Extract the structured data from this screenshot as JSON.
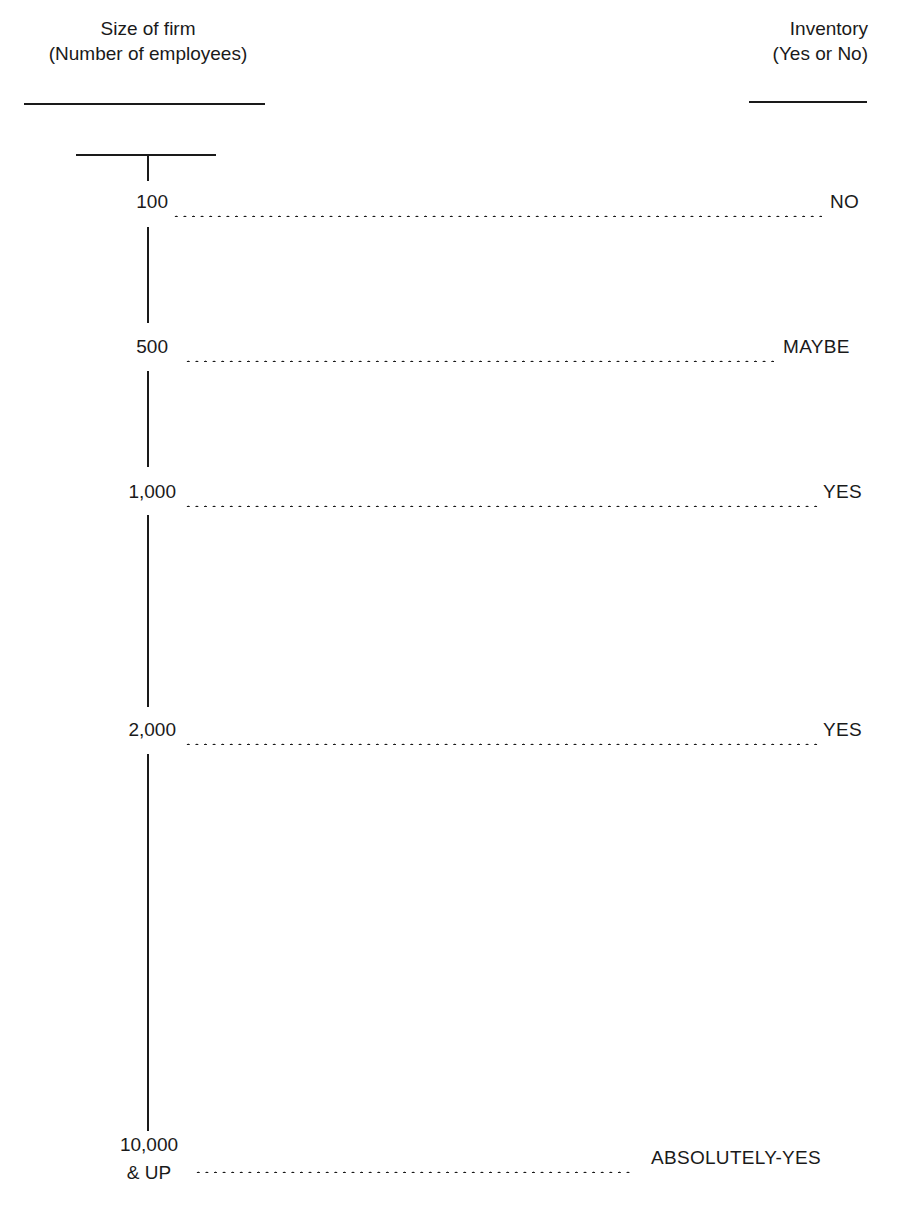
{
  "headers": {
    "left": {
      "line1": "Size of firm",
      "line2": "(Number of employees)"
    },
    "right": {
      "line1": "Inventory",
      "line2": "(Yes or No)"
    }
  },
  "rows": [
    {
      "size": "100",
      "inventory": "NO"
    },
    {
      "size": "500",
      "inventory": "MAYBE"
    },
    {
      "size": "1,000",
      "inventory": "YES"
    },
    {
      "size": "2,000",
      "inventory": "YES"
    },
    {
      "size_line1": "10,000",
      "size_line2": "& UP",
      "inventory": "ABSOLUTELY-YES"
    }
  ],
  "colors": {
    "ink": "#1a1a1a",
    "background": "#ffffff"
  }
}
